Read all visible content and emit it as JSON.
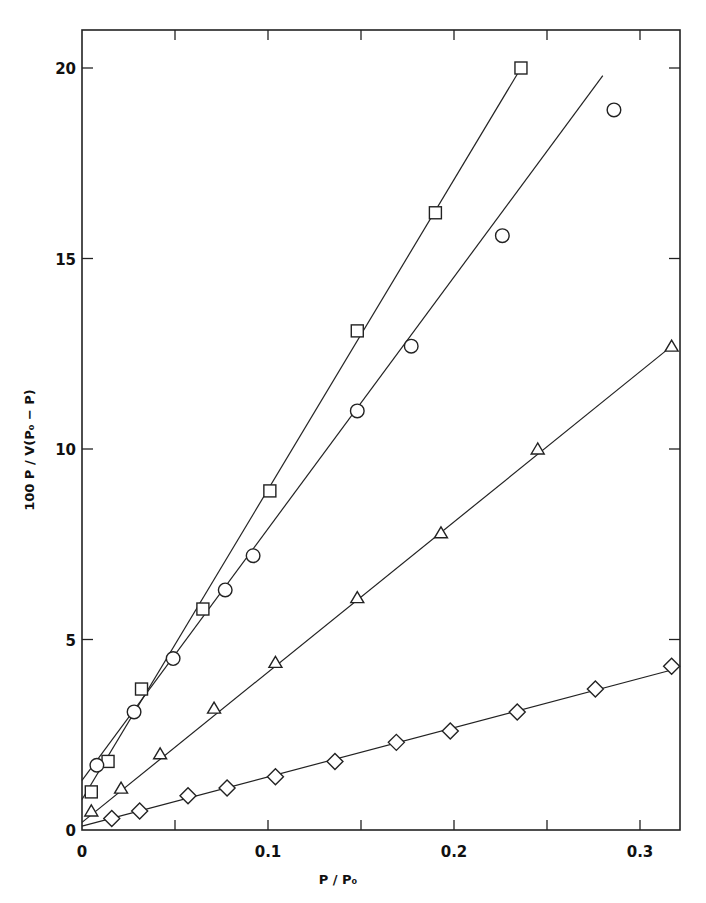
{
  "chart_data": {
    "type": "scatter",
    "title": "",
    "xlabel": "P / P₀",
    "ylabel": "100 P / V(P₀ − P)",
    "xlim": [
      0,
      0.32
    ],
    "ylim": [
      0,
      20.8
    ],
    "grid": false,
    "legend": null,
    "x_ticks": [
      0,
      0.05,
      0.1,
      0.15,
      0.2,
      0.25,
      0.3
    ],
    "x_tick_labels": [
      "0",
      "",
      "0.1",
      "",
      "0.2",
      "",
      "0.3"
    ],
    "y_ticks": [
      0,
      5,
      10,
      15,
      20
    ],
    "y_tick_labels": [
      "0",
      "5",
      "10",
      "15",
      "20"
    ],
    "series": [
      {
        "name": "squares",
        "marker": "square",
        "x": [
          0.005,
          0.014,
          0.032,
          0.065,
          0.101,
          0.148,
          0.19,
          0.236
        ],
        "y": [
          1.0,
          1.8,
          3.7,
          5.8,
          8.9,
          13.1,
          16.2,
          20.0
        ],
        "fit_line": {
          "x": [
            0.0,
            0.236
          ],
          "y": [
            0.8,
            20.0
          ]
        }
      },
      {
        "name": "circles",
        "marker": "circle",
        "x": [
          0.008,
          0.028,
          0.049,
          0.077,
          0.092,
          0.148,
          0.177,
          0.226,
          0.286
        ],
        "y": [
          1.7,
          3.1,
          4.5,
          6.3,
          7.2,
          11.0,
          12.7,
          15.6,
          18.9
        ],
        "fit_line": {
          "x": [
            0.0,
            0.28
          ],
          "y": [
            1.3,
            19.8
          ]
        }
      },
      {
        "name": "triangles",
        "marker": "triangle",
        "x": [
          0.005,
          0.021,
          0.042,
          0.071,
          0.104,
          0.148,
          0.193,
          0.245,
          0.317
        ],
        "y": [
          0.5,
          1.1,
          2.0,
          3.2,
          4.4,
          6.1,
          7.8,
          10.0,
          12.7
        ],
        "fit_line": {
          "x": [
            0.0,
            0.317
          ],
          "y": [
            0.2,
            12.7
          ]
        }
      },
      {
        "name": "diamonds",
        "marker": "diamond",
        "x": [
          0.016,
          0.031,
          0.057,
          0.078,
          0.104,
          0.136,
          0.169,
          0.198,
          0.234,
          0.276,
          0.317
        ],
        "y": [
          0.3,
          0.5,
          0.9,
          1.1,
          1.4,
          1.8,
          2.3,
          2.6,
          3.1,
          3.7,
          4.3
        ],
        "fit_line": {
          "x": [
            0.0,
            0.317
          ],
          "y": [
            0.1,
            4.2
          ]
        }
      }
    ]
  },
  "layout": {
    "plot_left_px": 82,
    "plot_right_px": 680,
    "plot_top_px": 30,
    "plot_bottom_px": 830,
    "x_px_per_unit": 1860,
    "y_px_per_unit": 38.1
  }
}
